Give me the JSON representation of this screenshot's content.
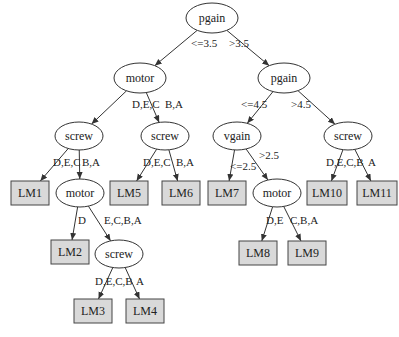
{
  "diagram": {
    "type": "decision-tree",
    "nodes": [
      {
        "id": "n1",
        "label": "pgain",
        "shape": "ellipse",
        "x": 212,
        "y": 18,
        "rx": 26,
        "ry": 15
      },
      {
        "id": "n2",
        "label": "motor",
        "shape": "ellipse",
        "x": 140,
        "y": 78,
        "rx": 26,
        "ry": 15
      },
      {
        "id": "n3",
        "label": "pgain",
        "shape": "ellipse",
        "x": 284,
        "y": 78,
        "rx": 26,
        "ry": 15
      },
      {
        "id": "n4",
        "label": "screw",
        "shape": "ellipse",
        "x": 79,
        "y": 136,
        "rx": 24,
        "ry": 14
      },
      {
        "id": "n5",
        "label": "screw",
        "shape": "ellipse",
        "x": 165,
        "y": 136,
        "rx": 24,
        "ry": 14
      },
      {
        "id": "n6",
        "label": "vgain",
        "shape": "ellipse",
        "x": 237,
        "y": 136,
        "rx": 24,
        "ry": 14
      },
      {
        "id": "n7",
        "label": "screw",
        "shape": "ellipse",
        "x": 348,
        "y": 136,
        "rx": 24,
        "ry": 14
      },
      {
        "id": "n8",
        "label": "LM1",
        "shape": "box",
        "x": 30,
        "y": 193,
        "w": 38,
        "h": 24
      },
      {
        "id": "n9",
        "label": "motor",
        "shape": "ellipse",
        "x": 80,
        "y": 193,
        "rx": 24,
        "ry": 14
      },
      {
        "id": "n10",
        "label": "LM5",
        "shape": "box",
        "x": 129,
        "y": 193,
        "w": 38,
        "h": 24
      },
      {
        "id": "n11",
        "label": "LM6",
        "shape": "box",
        "x": 181,
        "y": 193,
        "w": 38,
        "h": 24
      },
      {
        "id": "n12",
        "label": "LM7",
        "shape": "box",
        "x": 227,
        "y": 193,
        "w": 38,
        "h": 24
      },
      {
        "id": "n13",
        "label": "motor",
        "shape": "ellipse",
        "x": 277,
        "y": 193,
        "rx": 24,
        "ry": 14
      },
      {
        "id": "n14",
        "label": "LM10",
        "shape": "box",
        "x": 327,
        "y": 193,
        "w": 40,
        "h": 24
      },
      {
        "id": "n15",
        "label": "LM11",
        "shape": "box",
        "x": 377,
        "y": 193,
        "w": 40,
        "h": 24
      },
      {
        "id": "n16",
        "label": "LM2",
        "shape": "box",
        "x": 70,
        "y": 252,
        "w": 38,
        "h": 24
      },
      {
        "id": "n17",
        "label": "screw",
        "shape": "ellipse",
        "x": 119,
        "y": 254,
        "rx": 24,
        "ry": 14
      },
      {
        "id": "n18",
        "label": "LM8",
        "shape": "box",
        "x": 258,
        "y": 253,
        "w": 38,
        "h": 24
      },
      {
        "id": "n19",
        "label": "LM9",
        "shape": "box",
        "x": 307,
        "y": 253,
        "w": 38,
        "h": 24
      },
      {
        "id": "n20",
        "label": "LM3",
        "shape": "box",
        "x": 93,
        "y": 311,
        "w": 38,
        "h": 24
      },
      {
        "id": "n21",
        "label": "LM4",
        "shape": "box",
        "x": 145,
        "y": 311,
        "w": 38,
        "h": 24
      }
    ],
    "edges": [
      {
        "from": "n1",
        "to": "n2",
        "label": "<=3.5",
        "lx": 191,
        "ly": 47
      },
      {
        "from": "n1",
        "to": "n3",
        "label": ">3.5",
        "lx": 229,
        "ly": 47
      },
      {
        "from": "n2",
        "to": "n4",
        "label": "D,E,C",
        "lx": 132,
        "ly": 108
      },
      {
        "from": "n2",
        "to": "n5",
        "label": "B,A",
        "lx": 165,
        "ly": 108
      },
      {
        "from": "n3",
        "to": "n6",
        "label": "<=4.5",
        "lx": 241,
        "ly": 108
      },
      {
        "from": "n3",
        "to": "n7",
        "label": ">4.5",
        "lx": 291,
        "ly": 108
      },
      {
        "from": "n4",
        "to": "n8",
        "label": "D,E,C",
        "lx": 53,
        "ly": 166
      },
      {
        "from": "n4",
        "to": "n9",
        "label": "B,A",
        "lx": 82,
        "ly": 166
      },
      {
        "from": "n5",
        "to": "n10",
        "label": "D,E,C",
        "lx": 143,
        "ly": 166
      },
      {
        "from": "n5",
        "to": "n11",
        "label": "B,A",
        "lx": 176,
        "ly": 166
      },
      {
        "from": "n6",
        "to": "n12",
        "label": "<=2.5",
        "lx": 230,
        "ly": 170
      },
      {
        "from": "n6",
        "to": "n13",
        "label": ">2.5",
        "lx": 259,
        "ly": 159
      },
      {
        "from": "n7",
        "to": "n14",
        "label": "D,E,C,B",
        "lx": 326,
        "ly": 166
      },
      {
        "from": "n7",
        "to": "n15",
        "label": "A",
        "lx": 368,
        "ly": 166
      },
      {
        "from": "n9",
        "to": "n16",
        "label": "D",
        "lx": 78,
        "ly": 224
      },
      {
        "from": "n9",
        "to": "n17",
        "label": "E,C,B,A",
        "lx": 104,
        "ly": 224
      },
      {
        "from": "n13",
        "to": "n18",
        "label": "D,E",
        "lx": 266,
        "ly": 224
      },
      {
        "from": "n13",
        "to": "n19",
        "label": "C,B,A",
        "lx": 290,
        "ly": 224
      },
      {
        "from": "n17",
        "to": "n20",
        "label": "D,E,C,B",
        "lx": 95,
        "ly": 285
      },
      {
        "from": "n17",
        "to": "n21",
        "label": "A",
        "lx": 136,
        "ly": 285
      }
    ]
  }
}
